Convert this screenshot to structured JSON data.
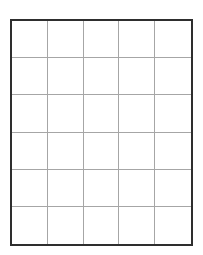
{
  "grid": {
    "columns": 5,
    "rows": 6,
    "border_color": "#2e2e2e",
    "line_color": "#a6a6a6",
    "cells": [
      [
        "",
        "",
        "",
        "",
        ""
      ],
      [
        "",
        "",
        "",
        "",
        ""
      ],
      [
        "",
        "",
        "",
        "",
        ""
      ],
      [
        "",
        "",
        "",
        "",
        ""
      ],
      [
        "",
        "",
        "",
        "",
        ""
      ],
      [
        "",
        "",
        "",
        "",
        ""
      ]
    ]
  }
}
